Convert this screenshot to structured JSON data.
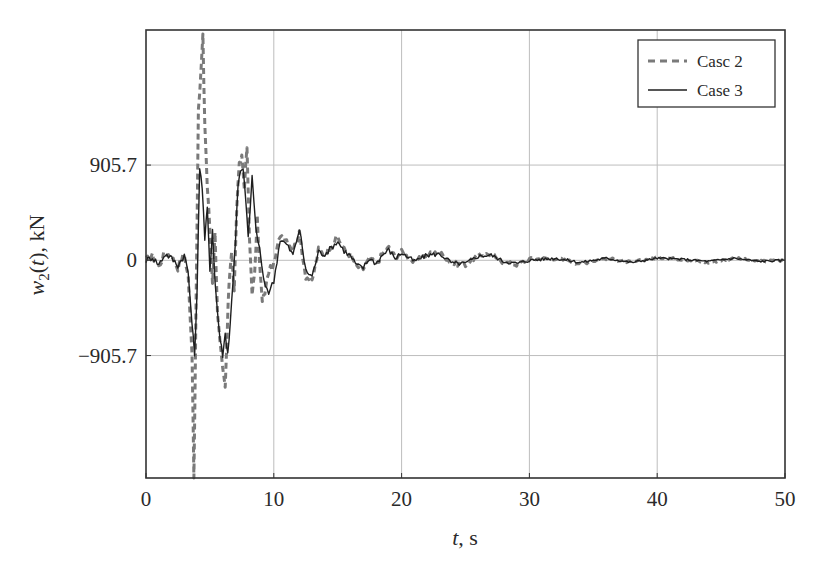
{
  "chart_data": {
    "type": "line",
    "title": "",
    "xlabel": "t, s",
    "ylabel": "w2(t), kN",
    "xlim": [
      0,
      50
    ],
    "ylim": [
      -2070,
      2190
    ],
    "xticks": [
      0,
      10,
      20,
      30,
      40,
      50
    ],
    "xtick_labels": [
      "0",
      "10",
      "20",
      "30",
      "40",
      "50"
    ],
    "yticks": [
      -905.7,
      0,
      905.7
    ],
    "ytick_labels": [
      "−905.7",
      "0",
      "905.7"
    ],
    "grid": true,
    "legend_position": "upper right",
    "series": [
      {
        "name": "Casc 2",
        "style": "dashed",
        "color": "#7a7a7a",
        "x": [
          0,
          0.5,
          1,
          1.5,
          2,
          2.5,
          3,
          3.3,
          3.6,
          3.75,
          3.9,
          4.1,
          4.3,
          4.45,
          4.6,
          4.8,
          5.0,
          5.2,
          5.4,
          5.6,
          5.8,
          6.0,
          6.2,
          6.35,
          6.5,
          6.7,
          6.9,
          7.1,
          7.3,
          7.5,
          7.7,
          7.9,
          8.1,
          8.3,
          8.5,
          8.7,
          8.9,
          9.1,
          9.3,
          9.6,
          10,
          10.5,
          11,
          11.5,
          12,
          12.5,
          13,
          13.5,
          14,
          14.5,
          15,
          15.5,
          16,
          16.5,
          17,
          17.5,
          18,
          18.5,
          19,
          19.5,
          20,
          21,
          22,
          23,
          24,
          25,
          26,
          27,
          28,
          29,
          30,
          32,
          34,
          36,
          38,
          40,
          42,
          44,
          46,
          48,
          50
        ],
        "y": [
          0,
          40,
          -60,
          80,
          30,
          -70,
          60,
          -150,
          -900,
          -2050,
          -600,
          1400,
          1800,
          2125,
          1300,
          700,
          300,
          -200,
          250,
          -500,
          -800,
          -1050,
          -1220,
          -700,
          -200,
          100,
          -300,
          500,
          900,
          1000,
          700,
          1077,
          200,
          -300,
          -150,
          400,
          -50,
          -400,
          -300,
          -100,
          -50,
          250,
          200,
          100,
          250,
          -150,
          -200,
          100,
          50,
          150,
          220,
          100,
          50,
          -60,
          -80,
          20,
          -40,
          60,
          120,
          30,
          80,
          -20,
          60,
          70,
          -30,
          -40,
          50,
          60,
          -20,
          -40,
          10,
          20,
          -30,
          20,
          -20,
          30,
          10,
          -20,
          20,
          -10,
          0
        ]
      },
      {
        "name": "Case 3",
        "style": "solid",
        "color": "#1e1e1e",
        "x": [
          0,
          0.5,
          1,
          1.5,
          2,
          2.5,
          3,
          3.3,
          3.6,
          3.8,
          4.0,
          4.2,
          4.4,
          4.6,
          4.8,
          5.0,
          5.2,
          5.4,
          5.6,
          5.8,
          6.0,
          6.2,
          6.4,
          6.6,
          6.8,
          7.0,
          7.2,
          7.4,
          7.6,
          7.8,
          8.0,
          8.3,
          8.6,
          8.9,
          9.2,
          9.6,
          10,
          10.5,
          11,
          11.5,
          12,
          12.5,
          13,
          13.5,
          14,
          14.5,
          15,
          15.5,
          16,
          16.5,
          17,
          17.5,
          18,
          18.5,
          19,
          19.5,
          20,
          21,
          22,
          23,
          24,
          25,
          26,
          27,
          28,
          29,
          30,
          32,
          34,
          36,
          38,
          40,
          42,
          44,
          46,
          48,
          50
        ],
        "y": [
          0,
          30,
          -40,
          60,
          20,
          -50,
          50,
          -120,
          -600,
          -900,
          -300,
          900,
          700,
          200,
          500,
          -100,
          300,
          -200,
          -500,
          -750,
          -900,
          -700,
          -880,
          -600,
          -200,
          200,
          700,
          850,
          850,
          600,
          200,
          800,
          300,
          100,
          -200,
          -300,
          -200,
          200,
          150,
          50,
          300,
          -100,
          -150,
          80,
          60,
          120,
          180,
          90,
          40,
          -50,
          -70,
          20,
          -30,
          50,
          100,
          20,
          70,
          -10,
          50,
          60,
          -30,
          -30,
          40,
          50,
          -10,
          -30,
          0,
          20,
          -20,
          20,
          -20,
          20,
          10,
          -10,
          20,
          -10,
          0
        ]
      }
    ]
  },
  "legend": {
    "items": [
      {
        "label": "Casc 2",
        "style": "dashed"
      },
      {
        "label": "Case 3",
        "style": "solid"
      }
    ]
  },
  "axes": {
    "xlabel_italic": "t",
    "xlabel_rest": ", s",
    "ylabel_italic": "w",
    "ylabel_sub": "2",
    "ylabel_paren": "(",
    "ylabel_t": "t",
    "ylabel_rest": "), kN"
  }
}
